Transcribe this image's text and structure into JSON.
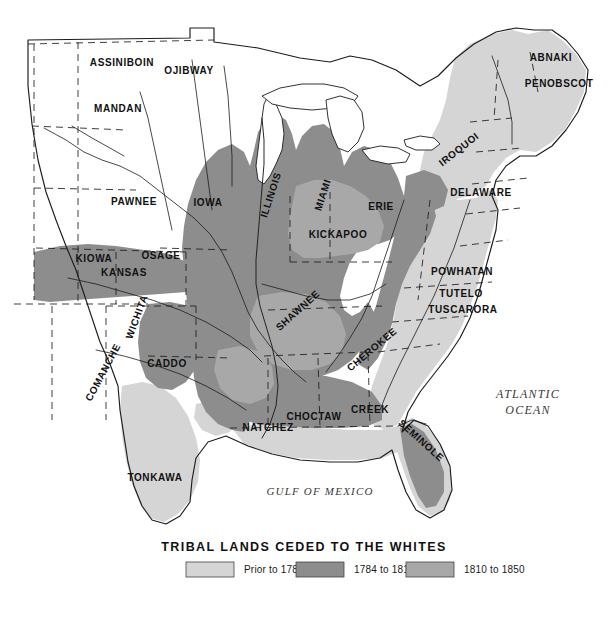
{
  "map": {
    "title": "TRIBAL LANDS CEDED TO THE WHITES",
    "ocean_labels": [
      {
        "name": "atlantic-ocean",
        "line1": "ATLANTIC",
        "line2": "OCEAN",
        "x": 528,
        "y": 398,
        "size": 12
      },
      {
        "name": "gulf-of-mexico",
        "line1": "GULF OF MEXICO",
        "line2": "",
        "x": 320,
        "y": 495,
        "size": 11
      }
    ],
    "tribes": [
      {
        "name": "assiniboin",
        "label": "ASSINIBOIN",
        "x": 122,
        "y": 66,
        "size": 10,
        "rotate": 0
      },
      {
        "name": "ojibway",
        "label": "OJIBWAY",
        "x": 189,
        "y": 74,
        "size": 10,
        "rotate": 0
      },
      {
        "name": "mandan",
        "label": "MANDAN",
        "x": 118,
        "y": 112,
        "size": 10,
        "rotate": 0
      },
      {
        "name": "abnaki",
        "label": "ABNAKI",
        "x": 551,
        "y": 61,
        "size": 10,
        "rotate": 0
      },
      {
        "name": "penobscot",
        "label": "PENOBSCOT",
        "x": 559,
        "y": 87,
        "size": 10,
        "rotate": 0
      },
      {
        "name": "pawnee",
        "label": "PAWNEE",
        "x": 134,
        "y": 205,
        "size": 10,
        "rotate": 0
      },
      {
        "name": "iowa",
        "label": "IOWA",
        "x": 208,
        "y": 206,
        "size": 10,
        "rotate": 0
      },
      {
        "name": "illinois",
        "label": "ILLINOIS",
        "x": 274,
        "y": 196,
        "size": 10,
        "rotate": -72
      },
      {
        "name": "miami",
        "label": "MIAMI",
        "x": 326,
        "y": 196,
        "size": 10,
        "rotate": -72
      },
      {
        "name": "erie",
        "label": "ERIE",
        "x": 381,
        "y": 210,
        "size": 10,
        "rotate": 0
      },
      {
        "name": "iroquoi",
        "label": "IROQUOI",
        "x": 461,
        "y": 152,
        "size": 10,
        "rotate": -38
      },
      {
        "name": "delaware",
        "label": "DELAWARE",
        "x": 481,
        "y": 196,
        "size": 10,
        "rotate": 0
      },
      {
        "name": "kickapoo",
        "label": "KICKAPOO",
        "x": 338,
        "y": 238,
        "size": 10,
        "rotate": 0
      },
      {
        "name": "kiowa",
        "label": "KIOWA",
        "x": 94,
        "y": 262,
        "size": 10,
        "rotate": 0
      },
      {
        "name": "osage",
        "label": "OSAGE",
        "x": 161,
        "y": 259,
        "size": 10,
        "rotate": 0
      },
      {
        "name": "kansas",
        "label": "KANSAS",
        "x": 124,
        "y": 276,
        "size": 10,
        "rotate": 0
      },
      {
        "name": "wichita",
        "label": "WICHITA",
        "x": 140,
        "y": 318,
        "size": 10,
        "rotate": -70
      },
      {
        "name": "powhatan",
        "label": "POWHATAN",
        "x": 462,
        "y": 275,
        "size": 10,
        "rotate": 0
      },
      {
        "name": "tutelo",
        "label": "TUTELO",
        "x": 461,
        "y": 297,
        "size": 10,
        "rotate": 0
      },
      {
        "name": "tuscarora",
        "label": "TUSCARORA",
        "x": 463,
        "y": 313,
        "size": 10,
        "rotate": 0
      },
      {
        "name": "shawnee",
        "label": "SHAWNEE",
        "x": 300,
        "y": 313,
        "size": 10,
        "rotate": -42
      },
      {
        "name": "comanche",
        "label": "COMANCHE",
        "x": 106,
        "y": 374,
        "size": 10,
        "rotate": -62
      },
      {
        "name": "caddo",
        "label": "CADDO",
        "x": 167,
        "y": 367,
        "size": 10,
        "rotate": 0
      },
      {
        "name": "cherokee",
        "label": "CHEROKEE",
        "x": 374,
        "y": 352,
        "size": 10,
        "rotate": -40
      },
      {
        "name": "choctaw",
        "label": "CHOCTAW",
        "x": 314,
        "y": 420,
        "size": 10,
        "rotate": 0
      },
      {
        "name": "creek",
        "label": "CREEK",
        "x": 370,
        "y": 413,
        "size": 10,
        "rotate": 0
      },
      {
        "name": "natchez",
        "label": "NATCHEZ",
        "x": 268,
        "y": 431,
        "size": 10,
        "rotate": 0
      },
      {
        "name": "seminole",
        "label": "SEMINOLE",
        "x": 419,
        "y": 443,
        "size": 10,
        "rotate": 42
      },
      {
        "name": "tonkawa",
        "label": "TONKAWA",
        "x": 155,
        "y": 481,
        "size": 10,
        "rotate": 0
      }
    ]
  },
  "legend": {
    "items": [
      {
        "name": "legend-prior-1784",
        "label": "Prior to 1784",
        "color": "#d5d5d5",
        "swatch_x": 186,
        "text_x": 244
      },
      {
        "name": "legend-1784-1810",
        "label": "1784 to 1810",
        "color": "#8d8d8d",
        "swatch_x": 296,
        "text_x": 354
      },
      {
        "name": "legend-1810-1850",
        "label": "1810 to 1850",
        "color": "#a8a8a8",
        "swatch_x": 406,
        "text_x": 464
      }
    ],
    "swatch_y": 562,
    "swatch_w": 48,
    "swatch_h": 15
  },
  "colors": {
    "prior_1784": "#d5d5d5",
    "period_1784_1810": "#8d8d8d",
    "period_1810_1850": "#a8a8a8",
    "unceded": "#ffffff",
    "outline": "#1c1c1c",
    "background": "#ffffff"
  }
}
